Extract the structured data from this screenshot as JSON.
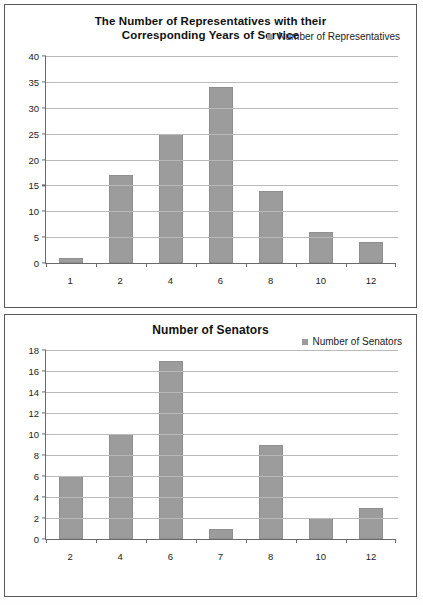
{
  "charts": [
    {
      "title": "The Number of Representatives with their Corresponding Years of Service",
      "title_line1": "The Number of Representatives with their",
      "title_line2": "Corresponding Years of Service",
      "legend_label": "Number of Representatives",
      "bar_color": "#9c9c9c",
      "grid_color": "#b9b9b9",
      "axis_color": "#6a6a6a"
    },
    {
      "title": "Number of Senators",
      "legend_label": "Number of Senators",
      "bar_color": "#9c9c9c",
      "grid_color": "#b9b9b9",
      "axis_color": "#6a6a6a"
    }
  ],
  "chart_data": [
    {
      "type": "bar",
      "title": "The Number of Representatives with their Corresponding Years of Service",
      "xlabel": "",
      "ylabel": "",
      "categories": [
        "1",
        "2",
        "4",
        "6",
        "8",
        "10",
        "12"
      ],
      "values": [
        1,
        17,
        25,
        34,
        14,
        6,
        4
      ],
      "series": [
        {
          "name": "Number of Representatives",
          "values": [
            1,
            17,
            25,
            34,
            14,
            6,
            4
          ]
        }
      ],
      "ylim": [
        0,
        40
      ],
      "yticks": [
        0,
        5,
        10,
        15,
        20,
        25,
        30,
        35,
        40
      ],
      "ytick_labels": [
        "0",
        "5",
        "10",
        "15",
        "20",
        "25",
        "30",
        "35",
        "40"
      ],
      "grid": true,
      "legend": [
        "Number of Representatives"
      ],
      "legend_position": "top-right"
    },
    {
      "type": "bar",
      "title": "Number of Senators",
      "xlabel": "",
      "ylabel": "",
      "categories": [
        "2",
        "4",
        "6",
        "7",
        "8",
        "10",
        "12"
      ],
      "values": [
        6,
        10,
        17,
        1,
        9,
        2,
        3
      ],
      "series": [
        {
          "name": "Number of Senators",
          "values": [
            6,
            10,
            17,
            1,
            9,
            2,
            3
          ]
        }
      ],
      "ylim": [
        0,
        18
      ],
      "yticks": [
        0,
        2,
        4,
        6,
        8,
        10,
        12,
        14,
        16,
        18
      ],
      "ytick_labels": [
        "0",
        "2",
        "4",
        "6",
        "8",
        "10",
        "12",
        "14",
        "16",
        "18"
      ],
      "grid": true,
      "legend": [
        "Number of Senators"
      ],
      "legend_position": "top-right"
    }
  ]
}
